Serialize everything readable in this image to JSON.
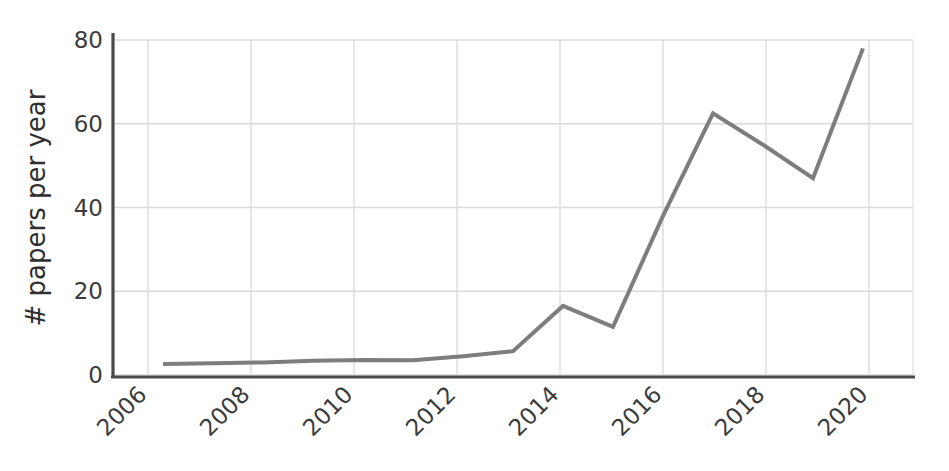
{
  "chart_data": {
    "type": "line",
    "title": "",
    "subtitle": "",
    "xlabel": "",
    "ylabel": "# papers per year",
    "x": [
      2006,
      2007,
      2008,
      2009,
      2010,
      2011,
      2012,
      2013,
      2014,
      2015,
      2016,
      2017,
      2018,
      2019,
      2020
    ],
    "values": [
      2.6,
      2.8,
      3.0,
      3.4,
      3.6,
      3.5,
      4.5,
      5.7,
      16.5,
      11.5,
      38.0,
      62.5,
      55.0,
      47.0,
      78.0
    ],
    "series": [
      {
        "name": "papers per year",
        "values": [
          2.6,
          2.8,
          3.0,
          3.4,
          3.6,
          3.5,
          4.5,
          5.7,
          16.5,
          11.5,
          38.0,
          62.5,
          55.0,
          47.0,
          78.0
        ],
        "color": "#7d7d7d"
      }
    ],
    "xlim": [
      2005,
      2021
    ],
    "ylim": [
      0,
      80
    ],
    "x_ticks": [
      2006,
      2008,
      2010,
      2012,
      2014,
      2016,
      2018,
      2020
    ],
    "x_tick_labels": [
      "2006",
      "2008",
      "2010",
      "2012",
      "2014",
      "2016",
      "2018",
      "2020"
    ],
    "y_ticks": [
      0,
      20,
      40,
      60,
      80
    ],
    "y_tick_labels": [
      "0",
      "20",
      "40",
      "60",
      "80"
    ],
    "grid": true,
    "grid_color": "#d9d9d9",
    "legend": false,
    "legend_position": "none",
    "annotations": [],
    "x_tick_label_rotation": 45,
    "line_width": 4,
    "axis_color": "#4a4a4a",
    "background_color": "#ffffff"
  },
  "axis_titles": {
    "y": "# papers per year"
  },
  "ticks": {
    "y0": "0",
    "y20": "20",
    "y40": "40",
    "y60": "60",
    "y80": "80",
    "x2006": "2006",
    "x2008": "2008",
    "x2010": "2010",
    "x2012": "2012",
    "x2014": "2014",
    "x2016": "2016",
    "x2018": "2018",
    "x2020": "2020"
  }
}
